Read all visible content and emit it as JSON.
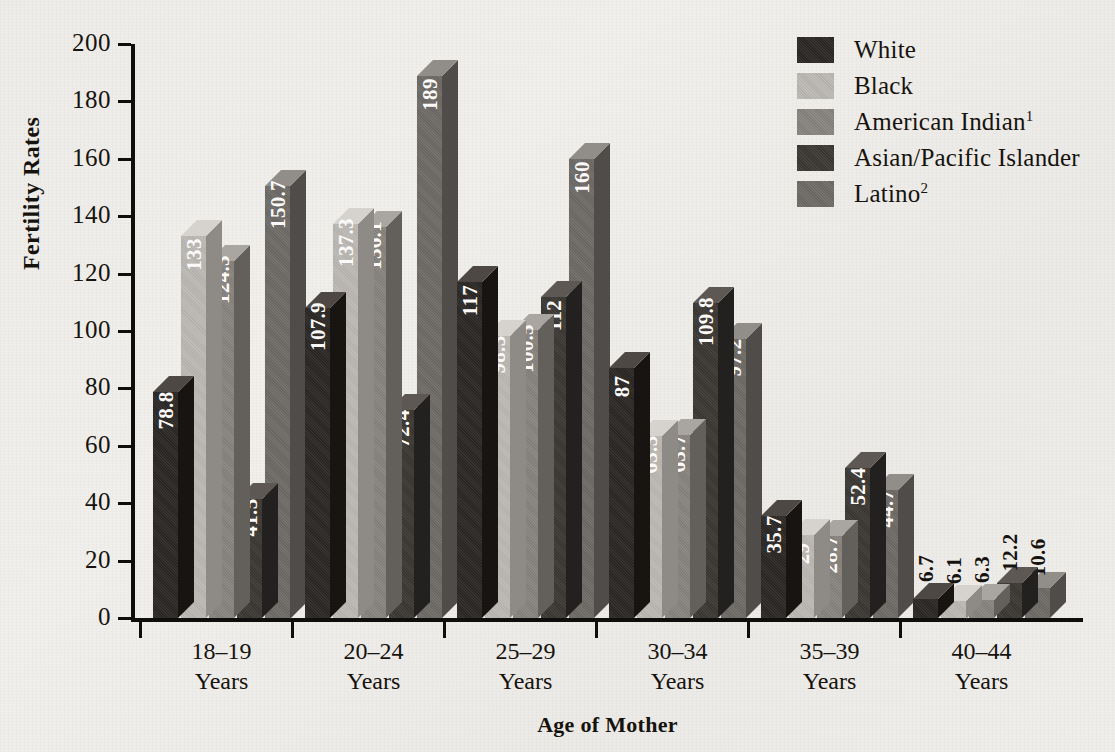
{
  "chart_data": {
    "type": "bar",
    "title": "",
    "xlabel": "Age of Mother",
    "ylabel": "Fertility Rates",
    "ylim": [
      0,
      200
    ],
    "ytick_step": 20,
    "yticks": [
      200,
      180,
      160,
      140,
      120,
      100,
      80,
      60,
      40,
      20,
      0
    ],
    "grid": false,
    "legend_position": "top-right",
    "three_d": true,
    "categories": [
      "18–19 Years",
      "20–24 Years",
      "25–29 Years",
      "30–34 Years",
      "35–39 Years",
      "40–44 Years"
    ],
    "category_lines": [
      [
        "18–19",
        "Years"
      ],
      [
        "20–24",
        "Years"
      ],
      [
        "25–29",
        "Years"
      ],
      [
        "30–34",
        "Years"
      ],
      [
        "35–39",
        "Years"
      ],
      [
        "40–44",
        "Years"
      ]
    ],
    "series": [
      {
        "name": "White",
        "footnote": "",
        "color": "#2b2724",
        "top_color": "#4d4844",
        "side_color": "#171412",
        "values": [
          78.8,
          107.9,
          117,
          87,
          35.7,
          6.7
        ],
        "labels": [
          "78.8",
          "107.9",
          "117",
          "87",
          "35.7",
          "6.7"
        ]
      },
      {
        "name": "Black",
        "footnote": "",
        "color": "#bcb9b4",
        "top_color": "#d6d3ce",
        "side_color": "#8e8b87",
        "values": [
          133,
          137.3,
          98.3,
          63.3,
          29,
          6.1
        ],
        "labels": [
          "133",
          "137.3",
          "98.3",
          "63.3",
          "29",
          "6.1"
        ]
      },
      {
        "name": "American Indian",
        "footnote": "1",
        "color": "#87837e",
        "top_color": "#a9a5a0",
        "side_color": "#63605c",
        "values": [
          124.3,
          136.1,
          100.5,
          63.7,
          28.7,
          6.3
        ],
        "labels": [
          "124.3",
          "136.1",
          "100.5",
          "63.7",
          "28.7",
          "6.3"
        ]
      },
      {
        "name": "Asian/Pacific Islander",
        "footnote": "",
        "color": "#3b3733",
        "top_color": "#5d5854",
        "side_color": "#232020",
        "values": [
          41.5,
          72.4,
          112,
          109.8,
          52.4,
          12.2
        ],
        "labels": [
          "41.5",
          "72.4",
          "112",
          "109.8",
          "52.4",
          "12.2"
        ]
      },
      {
        "name": "Latino",
        "footnote": "2",
        "color": "#6e6a66",
        "top_color": "#918d88",
        "side_color": "#4f4c49",
        "values": [
          150.7,
          189,
          160,
          97.2,
          44.7,
          10.6
        ],
        "labels": [
          "150.7",
          "189",
          "160",
          "97.2",
          "44.7",
          "10.6"
        ]
      }
    ]
  },
  "axes": {
    "ylabel": "Fertility Rates",
    "xlabel": "Age of Mother"
  },
  "legend": {
    "items": [
      {
        "label": "White",
        "footnote": "",
        "color": "#2b2724"
      },
      {
        "label": "Black",
        "footnote": "",
        "color": "#bcb9b4"
      },
      {
        "label": "American Indian",
        "footnote": "1",
        "color": "#87837e"
      },
      {
        "label": "Asian/Pacific Islander",
        "footnote": "",
        "color": "#3b3733"
      },
      {
        "label": "Latino",
        "footnote": "2",
        "color": "#6e6a66"
      }
    ]
  }
}
